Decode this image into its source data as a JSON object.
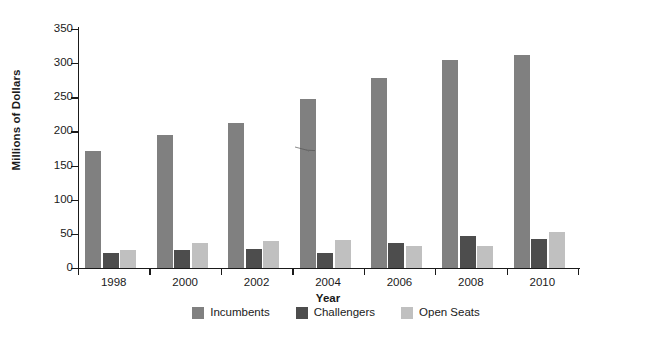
{
  "chart_data": {
    "type": "bar",
    "title": "",
    "xlabel": "Year",
    "ylabel": "Millions of Dollars",
    "categories": [
      "1998",
      "2000",
      "2002",
      "2004",
      "2006",
      "2008",
      "2010"
    ],
    "series": [
      {
        "name": "Incumbents",
        "color": "#808080",
        "values": [
          171,
          195,
          213,
          247,
          278,
          305,
          312
        ]
      },
      {
        "name": "Challengers",
        "color": "#4d4d4d",
        "values": [
          22,
          26,
          28,
          22,
          36,
          47,
          42
        ]
      },
      {
        "name": "Open Seats",
        "color": "#c0c0c0",
        "values": [
          26,
          36,
          39,
          41,
          32,
          32,
          53
        ]
      }
    ],
    "ylim": [
      0,
      350
    ],
    "ytick_values": [
      0,
      50,
      100,
      150,
      200,
      250,
      300,
      350
    ],
    "ytick_labels": [
      "0",
      "50",
      "100",
      "150",
      "200",
      "250",
      "300",
      "350"
    ],
    "grid": false,
    "legend_position": "bottom"
  },
  "legend": {
    "entries": [
      {
        "label": "Incumbents",
        "color": "#808080"
      },
      {
        "label": "Challengers",
        "color": "#4d4d4d"
      },
      {
        "label": "Open Seats",
        "color": "#c0c0c0"
      }
    ]
  },
  "axes": {
    "y_title": "Millions of Dollars",
    "x_title": "Year"
  }
}
